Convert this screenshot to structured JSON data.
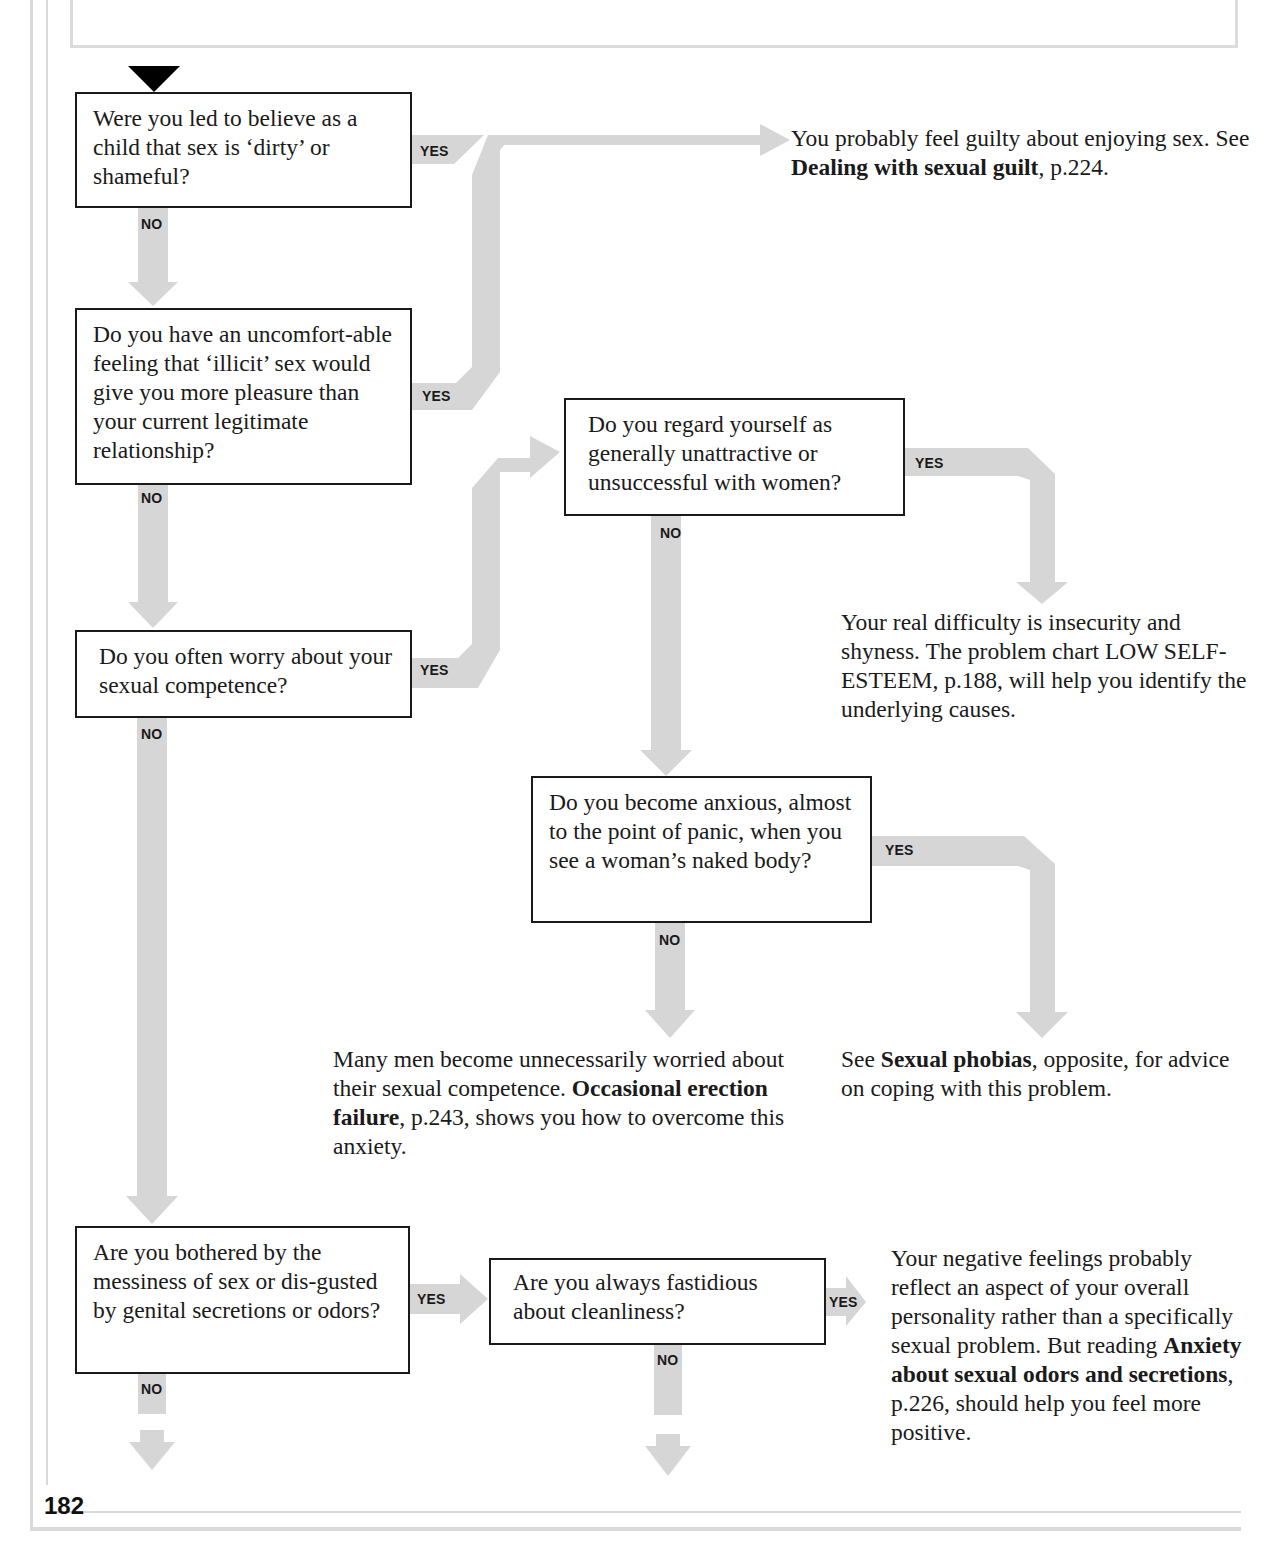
{
  "page": {
    "number": "182"
  },
  "questions": {
    "q1": {
      "text": "Were you led to believe as a child that sex is ‘dirty’ or shameful?"
    },
    "q2": {
      "text": "Do you have an uncomfort-able feeling that ‘illicit’ sex would give you more pleasure than your current legitimate relationship?"
    },
    "q3": {
      "text": "Do you often worry about your sexual competence?"
    },
    "q4": {
      "text": "Do you regard yourself as generally unattractive or unsuccessful with women?"
    },
    "q5": {
      "text": "Do you become anxious, almost to the point of panic, when you see a woman’s naked body?"
    },
    "q6": {
      "text": "Are you bothered by the messiness of sex or dis-gusted by genital secretions or odors?"
    },
    "q7": {
      "text": "Are you always fastidious about cleanliness?"
    }
  },
  "labels": {
    "yes": "YES",
    "no": "NO"
  },
  "results": {
    "guilt": {
      "pre": "You probably feel guilty about enjoying sex. See ",
      "bold": "Dealing with sexual guilt",
      "post": ", p.224."
    },
    "self_esteem": {
      "text": "Your real difficulty is insecurity and shyness. The problem chart LOW SELF-ESTEEM, p.188, will help you identify the underlying causes."
    },
    "competence": {
      "pre": "Many men become unnecessarily worried about their sexual competence. ",
      "bold": "Occasional erection failure",
      "post": ", p.243, shows you how to overcome this anxiety."
    },
    "phobias": {
      "pre": "See ",
      "bold": "Sexual phobias",
      "post": ", opposite, for advice on coping with this problem."
    },
    "odors": {
      "pre": "Your negative feelings probably reflect an aspect of your overall personality rather than a specifically sexual problem. But reading ",
      "bold": "Anxiety about sexual odors and secretions",
      "post": ", p.226, should help you feel more positive."
    }
  },
  "colors": {
    "arrow": "#d6d6d6",
    "box_border": "#1a1a1a",
    "start_marker": "#000000",
    "frame": "#d9d9d9"
  }
}
